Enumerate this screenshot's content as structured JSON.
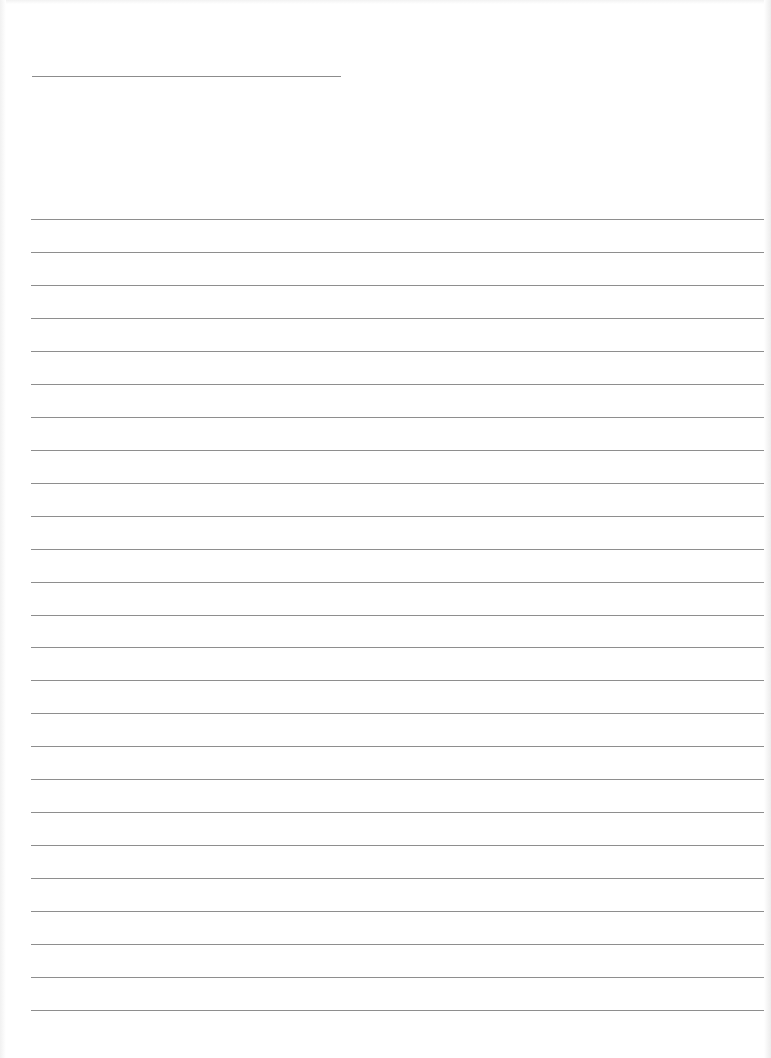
{
  "document": {
    "type": "ruled-notebook-page",
    "text_content": "",
    "colors": {
      "paper": "#ffffff",
      "rule": "#8e8e8e",
      "header_rule": "#8c8c8c"
    },
    "header_line": {
      "x": 32,
      "y": 76,
      "width": 309
    },
    "ruled_lines": {
      "count": 25,
      "first_y": 219,
      "spacing": 32.96,
      "x_start": 31,
      "x_end": 764
    }
  }
}
